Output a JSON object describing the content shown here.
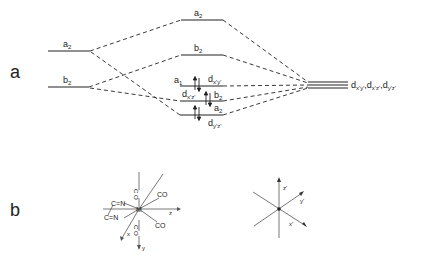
{
  "panels": {
    "a": {
      "label": "a",
      "left_levels": [
        {
          "sym": "a",
          "sub": "2"
        },
        {
          "sym": "b",
          "sub": "2"
        }
      ],
      "middle_levels": [
        {
          "sym": "a",
          "sub": "2",
          "role": "top"
        },
        {
          "sym": "b",
          "sub": "2",
          "role": "upper"
        },
        {
          "sym": "a",
          "sub": "1",
          "orbital": "d",
          "orb_sub": "x'y'",
          "electrons": 2
        },
        {
          "sym": "b",
          "sub": "2",
          "orbital": "d",
          "orb_sub": "x'z'",
          "electrons": 2
        },
        {
          "sym": "a",
          "sub": "2",
          "orbital": "d",
          "orb_sub": "y'z'",
          "electrons": 2
        }
      ],
      "right_label": "d x'y' , d x'z' , d y'z'",
      "right_label_parts": [
        {
          "d": "d",
          "sub": "x'y'"
        },
        {
          "d": "d",
          "sub": "x'z'"
        },
        {
          "d": "d",
          "sub": "y'z'"
        }
      ]
    },
    "b": {
      "label": "b",
      "molecule": {
        "center": "M",
        "ligands": [
          "CO",
          "CO",
          "CO",
          "CO",
          "CO",
          "C≡N",
          "C≡N"
        ],
        "top_ligand": "C O",
        "bottom_ligand": "C O",
        "ur_ligand": "CO",
        "lr_ligand": "CO",
        "cn_upper": "C=N",
        "cn_lower": "C=N",
        "axes": {
          "z": "z",
          "y": "y",
          "x": "x"
        }
      },
      "axes_frame": {
        "z": "z'",
        "y": "y'",
        "x": "x'"
      }
    }
  }
}
